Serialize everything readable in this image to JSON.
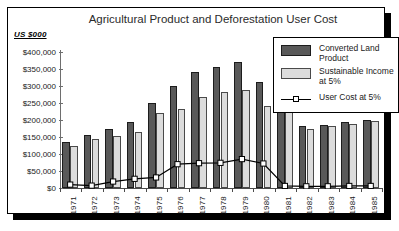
{
  "chart_data": {
    "type": "bar",
    "title": "Agricultural Product and Deforestation User Cost",
    "xlabel": "",
    "ylabel": "US $000",
    "ylim": [
      0,
      400000
    ],
    "ytick_step": 50000,
    "grid": false,
    "legend_position": "top-right",
    "categories": [
      "1971",
      "1972",
      "1973",
      "1974",
      "1975",
      "1976",
      "1977",
      "1978",
      "1979",
      "1980",
      "1981",
      "1982",
      "1983",
      "1984",
      "1985"
    ],
    "ytick_labels": [
      "$400,000",
      "$350,000",
      "$300,000",
      "$250,000",
      "$200,000",
      "$150,000",
      "$100,000",
      "$50,000",
      "$0"
    ],
    "ytick_values": [
      400000,
      350000,
      300000,
      250000,
      200000,
      150000,
      100000,
      50000,
      0
    ],
    "series": [
      {
        "name": "Converted Land Product",
        "type": "bar",
        "color": "#595959",
        "values": [
          135000,
          155000,
          175000,
          195000,
          250000,
          300000,
          340000,
          355000,
          371000,
          312000,
          230000,
          181000,
          186000,
          193000,
          199000
        ]
      },
      {
        "name": "Sustainable Income at 5%",
        "type": "bar",
        "color": "#dcdcdc",
        "values": [
          123000,
          145000,
          153000,
          165000,
          220000,
          233000,
          268000,
          282000,
          289000,
          241000,
          229000,
          173000,
          181000,
          187000,
          196000
        ]
      },
      {
        "name": "User Cost at 5%",
        "type": "line",
        "color": "#000000",
        "marker": "square",
        "values": [
          10000,
          7000,
          19000,
          27000,
          31000,
          70000,
          73000,
          74000,
          85000,
          72000,
          6000,
          5000,
          5000,
          6000,
          6000
        ]
      }
    ]
  },
  "legend": {
    "items": [
      {
        "label": "Converted Land Product",
        "swatch": "dark-bar-swatch"
      },
      {
        "label": "Sustainable Income at 5%",
        "swatch": "light-bar-swatch"
      },
      {
        "label": "User Cost at 5%",
        "swatch": "line-marker-swatch"
      }
    ]
  }
}
